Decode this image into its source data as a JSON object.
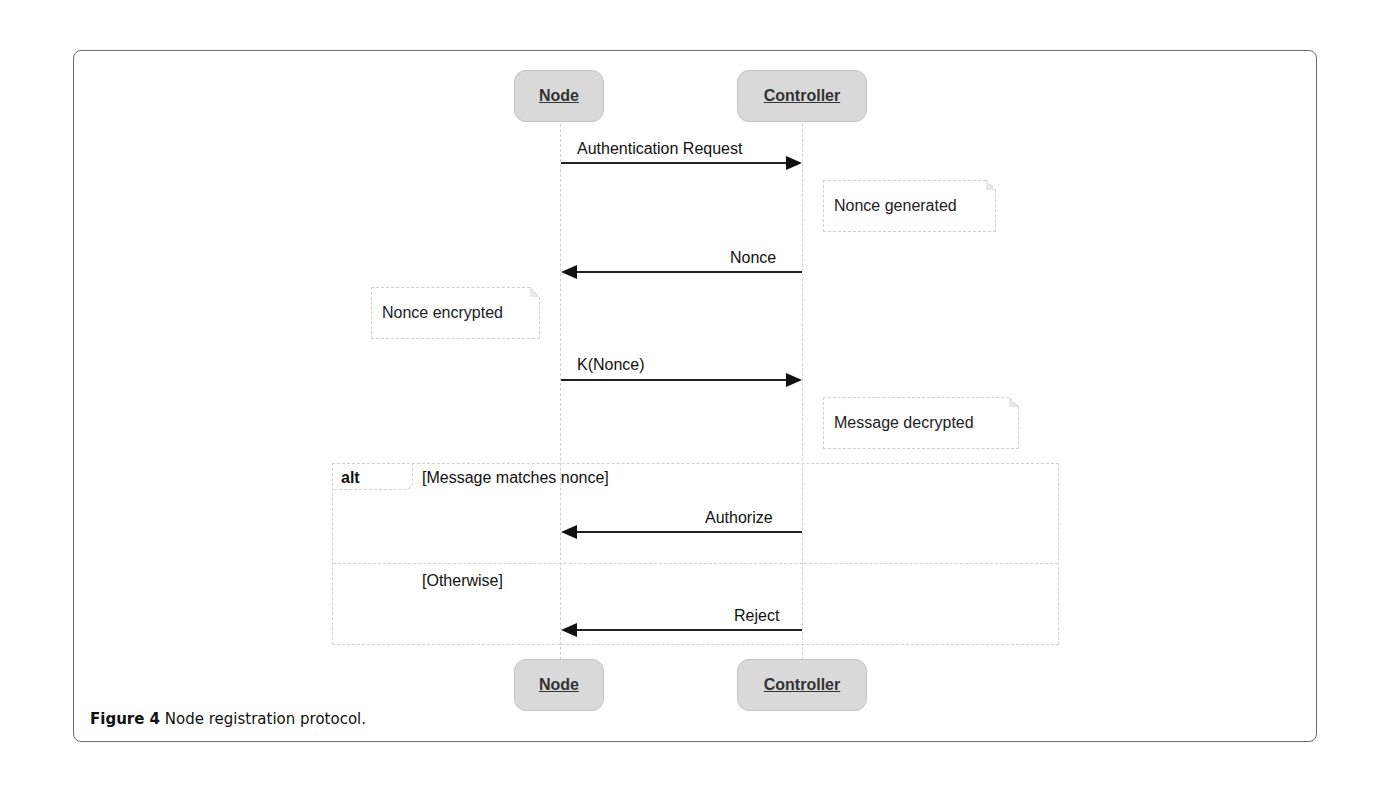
{
  "figure": {
    "caption_label": "Figure 4",
    "caption_text": " Node registration protocol."
  },
  "participants": {
    "node": {
      "label": "Node"
    },
    "controller": {
      "label": "Controller"
    }
  },
  "messages": [
    {
      "label": "Authentication Request",
      "from": "Node",
      "to": "Controller"
    },
    {
      "label": "Nonce",
      "from": "Controller",
      "to": "Node"
    },
    {
      "label": "K(Nonce)",
      "from": "Node",
      "to": "Controller"
    },
    {
      "label": "Authorize",
      "from": "Controller",
      "to": "Node"
    },
    {
      "label": "Reject",
      "from": "Controller",
      "to": "Node"
    }
  ],
  "notes": [
    {
      "label": "Nonce generated",
      "on": "Controller"
    },
    {
      "label": "Nonce encrypted",
      "on": "Node"
    },
    {
      "label": "Message decrypted",
      "on": "Controller"
    }
  ],
  "fragment": {
    "operator": "alt",
    "guards": [
      "[Message matches nonce]",
      "[Otherwise]"
    ]
  }
}
